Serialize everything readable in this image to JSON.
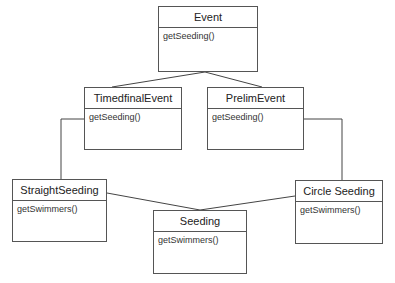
{
  "diagram": {
    "type": "uml-class",
    "classes": [
      {
        "id": "event",
        "name": "Event",
        "operations": [
          "getSeeding()"
        ]
      },
      {
        "id": "timedfinal",
        "name": "TimedfinalEvent",
        "operations": [
          "getSeeding()"
        ]
      },
      {
        "id": "prelim",
        "name": "PrelimEvent",
        "operations": [
          "getSeeding()"
        ]
      },
      {
        "id": "straight",
        "name": "StraightSeeding",
        "operations": [
          "getSwimmers()"
        ]
      },
      {
        "id": "seeding",
        "name": "Seeding",
        "operations": [
          "getSwimmers()"
        ]
      },
      {
        "id": "circle",
        "name": "Circle Seeding",
        "operations": [
          "getSwimmers()"
        ]
      }
    ],
    "relations": [
      {
        "from": "timedfinal",
        "to": "event"
      },
      {
        "from": "prelim",
        "to": "event"
      },
      {
        "from": "timedfinal",
        "to": "straight"
      },
      {
        "from": "prelim",
        "to": "circle"
      },
      {
        "from": "straight",
        "to": "seeding"
      },
      {
        "from": "circle",
        "to": "seeding"
      }
    ]
  }
}
